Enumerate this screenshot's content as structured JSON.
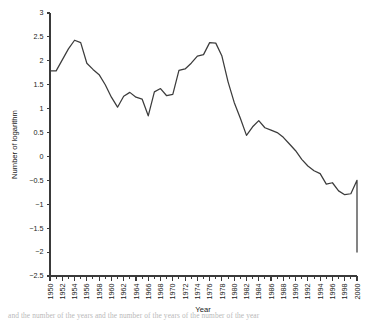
{
  "chart_data": {
    "type": "line",
    "title": "",
    "xlabel": "Year",
    "ylabel": "Number of logarithm",
    "xlim": [
      1950,
      2000
    ],
    "ylim": [
      -2.5,
      3
    ],
    "grid": false,
    "legend": null,
    "x_tick_step": 2,
    "x_minor_tick_step": 1,
    "y_tick_step": 0.5,
    "line_color": "#3c3c3c",
    "axis_color": "#3a3a3a",
    "x_tick_labels": [
      "1950",
      "1952",
      "1954",
      "1956",
      "1958",
      "1960",
      "1962",
      "1964",
      "1966",
      "1968",
      "1970",
      "1972",
      "1974",
      "1976",
      "1978",
      "1980",
      "1982",
      "1984",
      "1986",
      "1988",
      "1990",
      "1992",
      "1994",
      "1996",
      "1998",
      "2000"
    ],
    "y_tick_labels": [
      "3",
      "2.5",
      "2",
      "1.5",
      "1",
      "0.5",
      "0",
      "−0.5",
      "−1",
      "−1.5",
      "−2",
      "−2.5"
    ],
    "y_tick_values": [
      3,
      2.5,
      2,
      1.5,
      1,
      0.5,
      0,
      -0.5,
      -1,
      -1.5,
      -2,
      -2.5
    ],
    "x": [
      1950,
      1951,
      1952,
      1953,
      1954,
      1955,
      1956,
      1957,
      1958,
      1959,
      1960,
      1961,
      1962,
      1963,
      1964,
      1965,
      1966,
      1967,
      1968,
      1969,
      1970,
      1971,
      1972,
      1973,
      1974,
      1975,
      1976,
      1977,
      1978,
      1979,
      1980,
      1981,
      1982,
      1983,
      1984,
      1985,
      1986,
      1987,
      1988,
      1989,
      1990,
      1991,
      1992,
      1993,
      1994,
      1995,
      1996,
      1997,
      1998,
      1999,
      2000
    ],
    "values": [
      1.79,
      1.79,
      2.02,
      2.25,
      2.43,
      2.38,
      1.95,
      1.82,
      1.71,
      1.5,
      1.24,
      1.03,
      1.26,
      1.34,
      1.24,
      1.2,
      0.85,
      1.35,
      1.42,
      1.27,
      1.3,
      1.8,
      1.83,
      1.95,
      2.1,
      2.13,
      2.38,
      2.37,
      2.1,
      1.56,
      1.13,
      0.8,
      0.44,
      0.62,
      0.75,
      0.6,
      0.55,
      0.5,
      0.4,
      0.26,
      0.12,
      -0.06,
      -0.2,
      -0.3,
      -0.36,
      -0.58,
      -0.55,
      -0.72,
      -0.8,
      -0.78,
      -0.5
    ],
    "series_extra_x": [
      1994.5,
      1995,
      1996,
      1997,
      1998,
      1999,
      2000
    ],
    "series_extra_values": [
      -0.49,
      -0.5,
      -0.72,
      -1.2,
      -1.55,
      -1.8,
      -2.0
    ]
  },
  "caption": {
    "text": "and the number of the years and the number of the years of the number of the year"
  }
}
